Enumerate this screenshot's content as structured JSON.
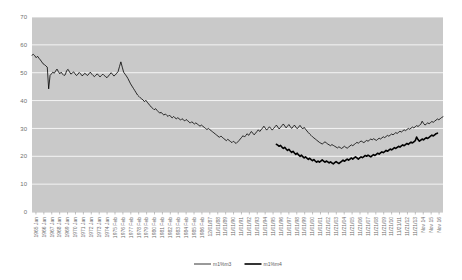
{
  "chart_data": {
    "type": "line",
    "title": "",
    "xlabel": "",
    "ylabel": "",
    "ylim": [
      0,
      70
    ],
    "ytick_labels": [
      "0",
      "10",
      "20",
      "30",
      "40",
      "50",
      "60",
      "70"
    ],
    "ytick_values": [
      0,
      10,
      20,
      30,
      40,
      50,
      60,
      70
    ],
    "grid": true,
    "grid_color": "#ffffff",
    "plot_bg_color": "#c9c9c9",
    "legend_position": "bottom",
    "x_tick_labels": [
      "1965 Jan",
      "1966 Jan",
      "1967 Jan",
      "1968 Jan",
      "1969 Jan",
      "1970 Jan",
      "1971 Jan",
      "1972 Jan",
      "1973 Jan",
      "1974 Jan",
      "1975 Feb",
      "1976 Feb",
      "1977 Feb",
      "1978 Feb",
      "1979 Feb",
      "1980 Feb",
      "1981 Feb",
      "1982 Feb",
      "1983 Feb",
      "1984 Feb",
      "1985 Feb",
      "1986 Feb",
      "12/01/87",
      "11/01/88",
      "11/01/89",
      "11/01/90",
      "11/01/91",
      "11/01/92",
      "11/01/93",
      "11/01/94",
      "11/01/95",
      "11/01/96",
      "11/01/97",
      "11/01/98",
      "11/01/99",
      "11/01/00",
      "11/01/01",
      "11/21/02",
      "11/21/03",
      "11/21/04",
      "11/21/05",
      "11/21/06",
      "11/21/07",
      "11/21/08",
      "11/21/09",
      "11/21/10",
      "11/21/11",
      "11/21/12",
      "11/21/13",
      "Nov 14",
      "Nov 15",
      "Nov 16"
    ],
    "series": [
      {
        "name": "m1%m3",
        "color": "#000000",
        "width": 0.8,
        "x_start": 0,
        "values": [
          56.3,
          56.6,
          56.1,
          55.4,
          55.9,
          55.2,
          54.6,
          53.9,
          53.2,
          52.9,
          52.4,
          52.0,
          44.2,
          49.0,
          49.6,
          50.2,
          49.8,
          50.6,
          51.3,
          50.4,
          49.6,
          50.2,
          49.5,
          49.0,
          49.3,
          50.8,
          51.2,
          50.3,
          49.5,
          49.9,
          50.3,
          49.6,
          49.0,
          49.4,
          50.1,
          49.6,
          48.9,
          49.2,
          49.8,
          49.4,
          49.0,
          49.6,
          50.2,
          49.5,
          49.0,
          48.6,
          49.1,
          49.6,
          49.0,
          48.5,
          49.0,
          49.5,
          49.0,
          48.6,
          48.2,
          48.8,
          49.4,
          50.0,
          49.4,
          48.8,
          49.2,
          49.8,
          50.4,
          52.2,
          53.9,
          52.0,
          50.2,
          49.5,
          48.8,
          48.0,
          47.0,
          46.0,
          45.2,
          44.4,
          43.6,
          42.8,
          42.0,
          41.5,
          41.0,
          40.6,
          40.2,
          39.6,
          40.1,
          39.4,
          38.8,
          38.2,
          37.6,
          37.2,
          36.7,
          37.1,
          36.5,
          36.0,
          35.5,
          35.8,
          35.2,
          34.8,
          35.2,
          34.7,
          34.3,
          34.8,
          34.2,
          33.8,
          34.3,
          33.8,
          33.4,
          33.9,
          33.4,
          33.0,
          33.5,
          33.1,
          32.7,
          33.2,
          32.8,
          32.4,
          31.9,
          32.4,
          32.0,
          31.6,
          32.0,
          31.6,
          31.2,
          30.8,
          31.2,
          30.8,
          30.4,
          30.0,
          29.6,
          30.0,
          29.6,
          29.2,
          28.8,
          28.4,
          28.0,
          27.6,
          27.2,
          26.8,
          27.3,
          26.8,
          26.4,
          26.0,
          25.6,
          26.1,
          25.7,
          25.3,
          24.9,
          25.4,
          25.0,
          24.6,
          25.1,
          25.6,
          26.2,
          26.8,
          27.4,
          26.9,
          27.5,
          28.1,
          27.5,
          28.2,
          28.9,
          28.3,
          27.7,
          28.3,
          28.9,
          29.5,
          28.9,
          29.5,
          30.1,
          30.8,
          30.1,
          29.4,
          30.0,
          30.6,
          30.0,
          29.4,
          30.0,
          30.6,
          31.2,
          30.5,
          29.8,
          30.4,
          31.0,
          31.6,
          30.9,
          30.2,
          30.8,
          31.4,
          30.7,
          30.0,
          30.6,
          31.2,
          30.5,
          29.9,
          30.5,
          31.1,
          30.4,
          29.8,
          30.4,
          29.7,
          29.1,
          28.5,
          28.0,
          27.5,
          27.0,
          26.6,
          26.2,
          25.8,
          25.4,
          25.0,
          24.7,
          24.4,
          24.8,
          25.2,
          24.8,
          24.4,
          24.1,
          23.8,
          24.2,
          23.9,
          23.6,
          23.3,
          23.0,
          23.4,
          23.1,
          22.8,
          23.2,
          23.6,
          23.2,
          22.9,
          23.3,
          23.7,
          24.1,
          23.8,
          24.2,
          24.6,
          25.0,
          24.7,
          25.1,
          25.5,
          25.2,
          24.9,
          25.3,
          25.7,
          25.4,
          25.8,
          26.2,
          25.9,
          26.3,
          26.0,
          25.7,
          26.1,
          26.5,
          26.2,
          26.6,
          27.0,
          26.7,
          27.1,
          27.5,
          27.2,
          27.6,
          28.0,
          27.7,
          28.1,
          28.5,
          28.2,
          28.6,
          29.0,
          28.7,
          29.1,
          29.5,
          29.2,
          29.6,
          30.0,
          29.7,
          30.1,
          30.5,
          30.2,
          30.6,
          31.0,
          30.7,
          31.1,
          31.5,
          32.6,
          31.8,
          31.2,
          31.6,
          32.0,
          31.7,
          32.1,
          32.5,
          32.2,
          32.6,
          33.0,
          33.4,
          33.1,
          33.5,
          33.9,
          34.2
        ]
      },
      {
        "name": "m1%m4",
        "color": "#000000",
        "width": 1.6,
        "x_start": 176,
        "values": [
          24.3,
          24.0,
          23.6,
          23.9,
          23.3,
          22.8,
          23.2,
          22.6,
          22.1,
          22.5,
          21.9,
          21.4,
          21.8,
          21.2,
          20.7,
          21.1,
          20.5,
          20.0,
          20.4,
          19.9,
          19.4,
          19.8,
          19.3,
          18.9,
          19.3,
          18.8,
          18.4,
          18.8,
          18.3,
          17.9,
          18.3,
          17.9,
          18.3,
          18.7,
          18.3,
          17.9,
          18.3,
          18.0,
          17.6,
          18.0,
          17.6,
          17.3,
          17.7,
          18.1,
          17.7,
          17.4,
          17.8,
          18.2,
          18.6,
          18.2,
          18.6,
          19.0,
          18.6,
          19.0,
          19.4,
          19.0,
          19.4,
          19.8,
          19.4,
          19.0,
          19.4,
          19.8,
          19.5,
          19.9,
          20.3,
          20.0,
          20.4,
          20.1,
          19.8,
          20.2,
          20.6,
          20.3,
          20.7,
          21.1,
          20.8,
          21.2,
          21.6,
          21.3,
          21.7,
          22.1,
          21.8,
          22.2,
          22.6,
          22.3,
          22.7,
          23.1,
          22.8,
          23.2,
          23.6,
          23.3,
          23.7,
          24.1,
          23.8,
          24.2,
          24.6,
          24.3,
          24.7,
          25.1,
          24.8,
          25.2,
          25.6,
          26.9,
          26.0,
          25.4,
          25.8,
          26.2,
          25.9,
          26.3,
          26.7,
          26.4,
          26.8,
          27.2,
          27.6,
          27.3,
          27.7,
          28.1,
          28.3
        ]
      }
    ]
  },
  "axes": {
    "y_axis_name": "value-axis",
    "x_axis_name": "date-axis"
  }
}
